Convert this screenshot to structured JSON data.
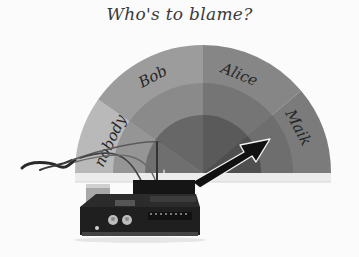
{
  "title": "Who's to blame?",
  "gauge": {
    "sectors": [
      {
        "label": "nobody",
        "color": "#b9b9b9",
        "inner_color": "#8f8f8f",
        "core_color": "#6d6d6d"
      },
      {
        "label": "Bob",
        "color": "#9c9c9c",
        "inner_color": "#878787",
        "core_color": "#666666"
      },
      {
        "label": "Alice",
        "color": "#838383",
        "inner_color": "#747474",
        "core_color": "#585858"
      },
      {
        "label": "Maik",
        "color": "#7a7a7a",
        "inner_color": "#6b6b6b",
        "core_color": "#4e4e4e"
      }
    ],
    "pointer_target": "Maik"
  },
  "device": {
    "name": "Arduino board"
  }
}
